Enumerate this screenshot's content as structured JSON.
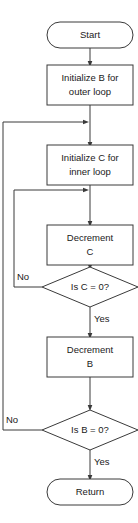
{
  "diagram": {
    "type": "flowchart",
    "orientation": "top-to-bottom",
    "colors": {
      "background": "#ffffff",
      "stroke": "#3a3a3a",
      "text": "#1a1a1a",
      "fill": "#ffffff"
    },
    "nodes": [
      {
        "id": "start",
        "shape": "terminator",
        "label": "Start"
      },
      {
        "id": "init_b",
        "shape": "process",
        "label_line1": "Initialize B for",
        "label_line2": "outer loop"
      },
      {
        "id": "init_c",
        "shape": "process",
        "label_line1": "Initialize C for",
        "label_line2": "inner loop"
      },
      {
        "id": "dec_c",
        "shape": "process",
        "label_line1": "Decrement",
        "label_line2": "C"
      },
      {
        "id": "test_c",
        "shape": "decision",
        "label": "Is C = 0?"
      },
      {
        "id": "dec_b",
        "shape": "process",
        "label_line1": "Decrement",
        "label_line2": "B"
      },
      {
        "id": "test_b",
        "shape": "decision",
        "label": "Is B = 0?"
      },
      {
        "id": "return",
        "shape": "terminator",
        "label": "Return"
      }
    ],
    "edges": [
      {
        "id": "e1",
        "from": "start",
        "to": "init_b",
        "label": ""
      },
      {
        "id": "e2",
        "from": "init_b",
        "to": "init_c",
        "label": ""
      },
      {
        "id": "e3",
        "from": "init_c",
        "to": "dec_c",
        "label": ""
      },
      {
        "id": "e4",
        "from": "dec_c",
        "to": "test_c",
        "label": ""
      },
      {
        "id": "e5",
        "from": "test_c",
        "to": "dec_c",
        "label": "No"
      },
      {
        "id": "e6",
        "from": "test_c",
        "to": "dec_b",
        "label": "Yes"
      },
      {
        "id": "e7",
        "from": "dec_b",
        "to": "test_b",
        "label": ""
      },
      {
        "id": "e8",
        "from": "test_b",
        "to": "init_c",
        "label": "No"
      },
      {
        "id": "e9",
        "from": "test_b",
        "to": "return",
        "label": "Yes"
      }
    ]
  }
}
